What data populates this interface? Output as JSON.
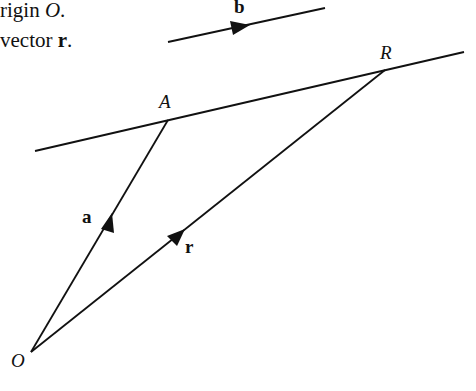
{
  "text_fragments": {
    "line1_text": "rigin ",
    "line1_var": "O",
    "line1_end": ".",
    "line2_text": "vector ",
    "line2_var": "r",
    "line2_end": "."
  },
  "labels": {
    "b": "b",
    "R": "R",
    "A": "A",
    "a": "a",
    "r": "r",
    "O": "O"
  },
  "geometry": {
    "O": [
      31,
      352
    ],
    "A": [
      168,
      120
    ],
    "R": [
      385,
      70
    ],
    "line_start": [
      35,
      151
    ],
    "line_end": [
      464,
      52
    ],
    "b_start": [
      168,
      42
    ],
    "b_end": [
      325,
      8
    ]
  },
  "colors": {
    "stroke": "#111111"
  }
}
